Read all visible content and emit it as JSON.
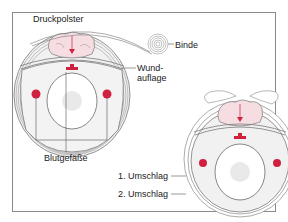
{
  "diagram": {
    "labels": {
      "druckpolster": "Druckpolster",
      "binde": "Binde",
      "wundauflage_line1": "Wund-",
      "wundauflage_line2": "auflage",
      "blutgefaesse": "Blutgefäße",
      "umschlag1": "1. Umschlag",
      "umschlag2": "2. Umschlag"
    },
    "colors": {
      "frame": "#8a8a8a",
      "outline": "#7a7a7a",
      "pad_fill": "#f6dde2",
      "vessel": "#d0203f",
      "tissue_fill": "#f1f1f1",
      "bone_fill": "#ffffff",
      "marrow": "#dcdcdc"
    }
  }
}
